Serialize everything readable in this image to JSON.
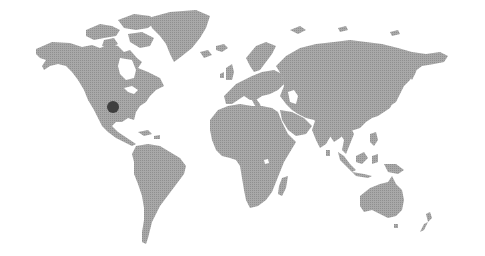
{
  "map": {
    "style": "dotted-halftone-world-map",
    "background_color": "#ffffff",
    "land_color": "#a6a6a6",
    "land_dot_color": "#8e8e8e",
    "marker": {
      "label": "location-marker",
      "region": "Texas, United States",
      "x": 113,
      "y": 107,
      "radius": 6,
      "color": "#3f3f3f"
    },
    "continents": [
      "North America",
      "Greenland",
      "South America",
      "Europe",
      "Africa",
      "Asia",
      "Australia",
      "New Zealand",
      "Madagascar",
      "Indonesia",
      "Japan",
      "United Kingdom",
      "Iceland"
    ]
  }
}
